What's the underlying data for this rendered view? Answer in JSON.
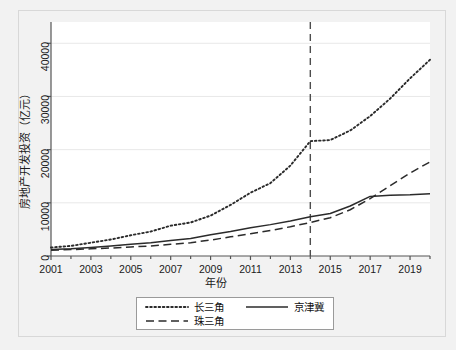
{
  "chart_data": {
    "type": "line",
    "title": "",
    "subtitle": "",
    "xlabel": "年份",
    "ylabel": "房地产开发投资（亿元）",
    "xlim": [
      2001,
      2020
    ],
    "ylim": [
      0,
      44000
    ],
    "grid": true,
    "grid_axis": "y",
    "legend_position": "bottom-center",
    "x": [
      2001,
      2002,
      2003,
      2004,
      2005,
      2006,
      2007,
      2008,
      2009,
      2010,
      2011,
      2012,
      2013,
      2014,
      2015,
      2016,
      2017,
      2018,
      2019,
      2020
    ],
    "xticks": [
      "2001",
      "2003",
      "2005",
      "2007",
      "2009",
      "2011",
      "2013",
      "2015",
      "2017",
      "2019"
    ],
    "xtick_values": [
      2001,
      2003,
      2005,
      2007,
      2009,
      2011,
      2013,
      2015,
      2017,
      2019
    ],
    "yticks": [
      "0",
      "10000",
      "20000",
      "30000",
      "40000"
    ],
    "ytick_values": [
      0,
      10000,
      20000,
      30000,
      40000
    ],
    "series": [
      {
        "name": "长三角",
        "style": "dotted",
        "color": "#2b2b2b",
        "values": [
          1600,
          1900,
          2500,
          3100,
          3900,
          4600,
          5700,
          6300,
          7600,
          9600,
          11900,
          13700,
          17000,
          21600,
          21800,
          23600,
          26300,
          29600,
          33400,
          36900
        ]
      },
      {
        "name": "京津冀",
        "style": "solid",
        "color": "#2b2b2b",
        "values": [
          1200,
          1350,
          1600,
          1900,
          2200,
          2500,
          2900,
          3300,
          4000,
          4600,
          5300,
          5900,
          6600,
          7400,
          8000,
          9400,
          11200,
          11400,
          11500,
          11700
        ]
      },
      {
        "name": "珠三角",
        "style": "dashed",
        "color": "#2b2b2b",
        "values": [
          1100,
          1200,
          1350,
          1500,
          1700,
          1900,
          2200,
          2500,
          3000,
          3600,
          4200,
          4800,
          5500,
          6300,
          7200,
          8700,
          10800,
          13200,
          15600,
          17700
        ]
      }
    ],
    "annotations": [
      {
        "type": "vline",
        "name": "policy-reference-line",
        "x": 2014,
        "style": "dashed",
        "color": "#4d4d4d",
        "label": ""
      }
    ]
  },
  "axes": {
    "ylabel": "房地产开发投资（亿元）",
    "xlabel": "年份"
  },
  "legend": {
    "items": [
      {
        "label": "长三角",
        "style": "dotted"
      },
      {
        "label": "京津冀",
        "style": "solid"
      },
      {
        "label": "珠三角",
        "style": "dashed"
      }
    ]
  },
  "colors": {
    "figure_background": "#f2f2f2",
    "plot_background": "#ffffff",
    "line": "#2b2b2b",
    "grid": "#e8e8e8",
    "axis": "#555555",
    "frame": "#d8d8d8",
    "reference_line": "#4d4d4d"
  }
}
